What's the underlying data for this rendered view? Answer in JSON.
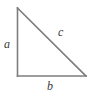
{
  "figure": {
    "kind": "right-triangle-diagram",
    "background_color": "#ffffff",
    "stroke_color": "#7d7d7d",
    "label_color": "#3a3a3a",
    "stroke_width": 1.6,
    "width": 90,
    "height": 98
  },
  "geometry": {
    "apex": {
      "x": 17.5,
      "y": 8
    },
    "right_angle_vertex": {
      "x": 17.5,
      "y": 76
    },
    "base_end_vertex": {
      "x": 86,
      "y": 76
    },
    "polygon_points": "17.5,8 17.5,76 86,76"
  },
  "labels": {
    "leg_vertical": "a",
    "leg_horizontal": "b",
    "hypotenuse": "c"
  },
  "sides": [
    {
      "name": "vertical-leg",
      "label": "a",
      "x1": 17.5,
      "y1": 8,
      "x2": 17.5,
      "y2": 76
    },
    {
      "name": "horizontal-leg",
      "label": "b",
      "x1": 17.5,
      "y1": 76,
      "x2": 86,
      "y2": 76
    },
    {
      "name": "hypotenuse",
      "label": "c",
      "x1": 17.5,
      "y1": 8,
      "x2": 86,
      "y2": 76
    }
  ]
}
